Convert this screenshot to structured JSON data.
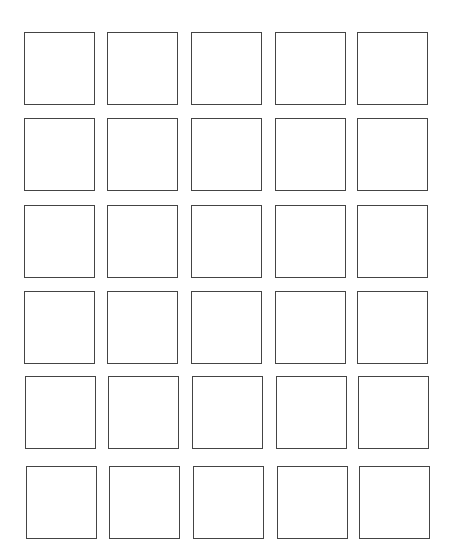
{
  "grid": {
    "rows": 6,
    "cols": 5,
    "border_color": "#444444",
    "background": "#ffffff",
    "cell_width": 71,
    "cell_height": 73,
    "rows_layout": [
      {
        "top": 32,
        "lefts": [
          24,
          107,
          191,
          275,
          357
        ]
      },
      {
        "top": 118,
        "lefts": [
          24,
          107,
          191,
          275,
          357
        ]
      },
      {
        "top": 205,
        "lefts": [
          24,
          107,
          191,
          275,
          357
        ]
      },
      {
        "top": 291,
        "lefts": [
          24,
          107,
          191,
          275,
          357
        ]
      },
      {
        "top": 376,
        "lefts": [
          25,
          108,
          192,
          276,
          358
        ]
      },
      {
        "top": 466,
        "lefts": [
          26,
          109,
          193,
          277,
          359
        ]
      }
    ]
  }
}
